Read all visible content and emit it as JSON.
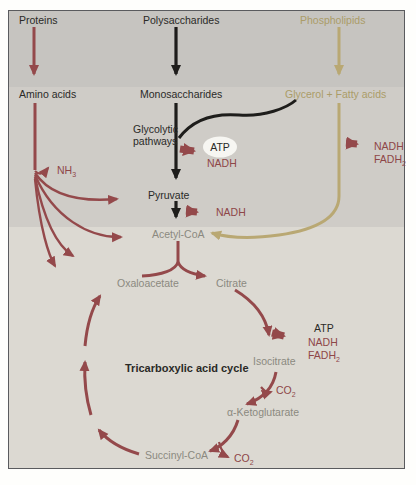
{
  "colors": {
    "maroon": "#94494b",
    "maroon_text": "#8e4648",
    "black_arrow": "#1e1d1b",
    "tan": "#b9a873",
    "tan_text": "#ab9c68",
    "gray_label": "#8b8980",
    "band_top": "#c6c4c0",
    "band_middle": "#cfccc7",
    "band_bottom": "#dcd9d2",
    "atp_oval": "#f7f6f2"
  },
  "sources": {
    "proteins": "Proteins",
    "polysaccharides": "Polysaccharides",
    "phospholipids": "Phospholipids"
  },
  "products": {
    "amino_acids": "Amino acids",
    "monosaccharides": "Monosaccharides",
    "glycerol_fatty_acids": "Glycerol + Fatty acids"
  },
  "glycolysis": {
    "label_line1": "Glycolytic",
    "label_line2": "pathways",
    "atp": "ATP",
    "nadh": "NADH"
  },
  "fatty_acid_oxidation": {
    "nadh": "NADH",
    "fadh": "FADH",
    "fadh_sub": "2"
  },
  "deamination": {
    "nh": "NH",
    "nh_sub": "3"
  },
  "pyruvate": {
    "label": "Pyruvate",
    "nadh": "NADH"
  },
  "acetyl_coa": {
    "label": "Acetyl-CoA"
  },
  "tca": {
    "title": "Tricarboxylic acid cycle",
    "oxaloacetate": "Oxaloacetate",
    "citrate": "Citrate",
    "isocitrate": "Isocitrate",
    "alpha_ketoglutarate": "α-Ketoglutarate",
    "succinyl_coa": "Succinyl-CoA",
    "atp": "ATP",
    "nadh": "NADH",
    "fadh": "FADH",
    "fadh_sub": "2",
    "co2_a": {
      "base": "CO",
      "sub": "2"
    },
    "co2_b": {
      "base": "CO",
      "sub": "2"
    }
  }
}
